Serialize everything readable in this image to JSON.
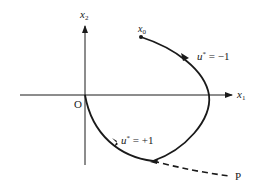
{
  "diagram": {
    "type": "phase-plane trajectory",
    "axes": {
      "horizontal_label": "x",
      "horizontal_sub": "1",
      "vertical_label": "x",
      "vertical_sub": "2",
      "origin_label": "O"
    },
    "points": {
      "start_label": "x",
      "start_sub": "0",
      "end_label": "P"
    },
    "segments": [
      {
        "label_u": "u",
        "label_star": "*",
        "label_rest": " = −1",
        "style": "solid"
      },
      {
        "label_u": "u",
        "label_star": "*",
        "label_rest": " = +1",
        "style": "solid"
      },
      {
        "style": "dashed"
      }
    ],
    "colors": {
      "stroke": "#1a1a1a",
      "background": "#ffffff"
    }
  }
}
